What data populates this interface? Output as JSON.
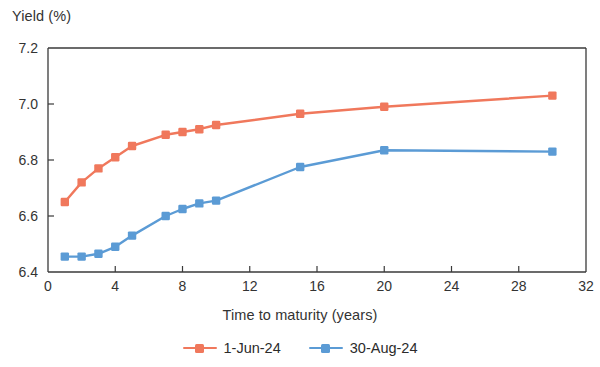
{
  "chart_data": {
    "type": "line",
    "title": "",
    "ylabel": "Yield (%)",
    "xlabel": "Time to maturity (years)",
    "xlim": [
      0,
      32
    ],
    "ylim": [
      6.4,
      7.2
    ],
    "xticks": [
      0,
      4,
      8,
      12,
      16,
      20,
      24,
      28,
      32
    ],
    "xtick_labels": [
      "0",
      "4",
      "8",
      "12",
      "16",
      "20",
      "24",
      "28",
      "32"
    ],
    "yticks": [
      6.4,
      6.6,
      6.8,
      7.0,
      7.2
    ],
    "ytick_labels": [
      "6.4",
      "6.6",
      "6.8",
      "7.0",
      "7.2"
    ],
    "grid": false,
    "legend_position": "bottom-center",
    "x": [
      1,
      2,
      3,
      4,
      5,
      7,
      8,
      9,
      10,
      15,
      20,
      30
    ],
    "series": [
      {
        "name": "1-Jun-24",
        "color": "#F0785C",
        "marker": "square",
        "values": [
          6.65,
          6.72,
          6.77,
          6.81,
          6.85,
          6.89,
          6.9,
          6.91,
          6.925,
          6.965,
          6.99,
          7.03
        ]
      },
      {
        "name": "30-Aug-24",
        "color": "#5B9BD5",
        "marker": "square",
        "values": [
          6.455,
          6.455,
          6.465,
          6.49,
          6.53,
          6.6,
          6.625,
          6.645,
          6.655,
          6.775,
          6.835,
          6.83
        ]
      }
    ]
  },
  "legend": {
    "entries": [
      {
        "label": "1-Jun-24"
      },
      {
        "label": "30-Aug-24"
      }
    ]
  },
  "colors": {
    "series_red": "#F0785C",
    "series_blue": "#5B9BD5",
    "axis": "#3a3a3a",
    "text": "#2b2b2b",
    "background": "#ffffff"
  }
}
